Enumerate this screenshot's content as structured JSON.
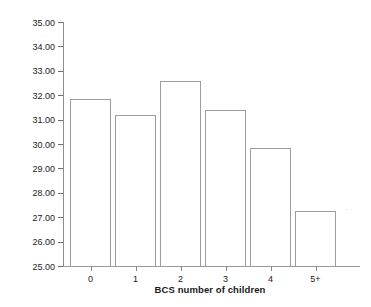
{
  "chart_data": {
    "type": "bar",
    "title": "",
    "subtitle": "",
    "xlabel": "BCS number of children",
    "ylabel": "BCS mean self-control",
    "categories": [
      "0",
      "1",
      "2",
      "3",
      "4",
      "5+"
    ],
    "values": [
      31.85,
      31.2,
      32.6,
      31.38,
      29.85,
      27.25
    ],
    "series": [
      {
        "name": "BCS mean self-control",
        "values": [
          31.85,
          31.2,
          32.6,
          31.38,
          29.85,
          27.25
        ]
      }
    ],
    "ylim": [
      25.0,
      35.0
    ],
    "y_ticks": [
      25.0,
      26.0,
      27.0,
      28.0,
      29.0,
      30.0,
      31.0,
      32.0,
      33.0,
      34.0,
      35.0
    ],
    "y_tick_labels": [
      "25.00",
      "26.00",
      "27.00",
      "28.00",
      "29.00",
      "30.00",
      "31.00",
      "32.00",
      "33.00",
      "34.00",
      "35.00"
    ],
    "grid": false,
    "legend": null,
    "legend_position": "none",
    "bar_style": {
      "fill": "#ffffff",
      "edge": "#9d9d9d"
    },
    "annotations": []
  },
  "axes": {
    "y_title": "BCS mean self-control",
    "x_title": "BCS number of children"
  }
}
